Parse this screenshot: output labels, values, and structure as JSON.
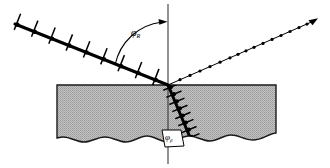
{
  "figure": {
    "background_color": "#ffffff",
    "width": 330,
    "height": 168
  },
  "labels": {
    "angle_of_incidence": {
      "symbol": "φ",
      "subscript": "R"
    },
    "angle_of_refraction": {
      "symbol": "φ",
      "subscript": "β"
    }
  },
  "elements": {
    "normal_line": {
      "name": "normal-line",
      "x": 168,
      "y_top": 4,
      "y_bottom": 164,
      "color": "#3a3a3a"
    },
    "medium_block": {
      "name": "medium-block",
      "left": 57,
      "right": 276,
      "top": 85,
      "bottom": 140,
      "fill_color": "#b9b9b9",
      "edge_color": "#1a1a1a",
      "texture": "halftone-dot-screen"
    },
    "incident_ray": {
      "name": "incident-ray",
      "x1": 15,
      "y1": 24,
      "x2": 168,
      "y2": 85,
      "style": "thick-barbed",
      "color": "#000000",
      "tick_count": 9,
      "dot_count": 9
    },
    "reflected_ray": {
      "name": "reflected-ray",
      "x1": 168,
      "y1": 85,
      "x2": 318,
      "y2": 19,
      "style": "thin-dotted",
      "color": "#000000",
      "dot_count": 15,
      "arrowhead": true
    },
    "refracted_ray": {
      "name": "refracted-ray",
      "x1": 168,
      "y1": 85,
      "x2": 192,
      "y2": 141,
      "style": "thick-barbed",
      "color": "#000000",
      "tick_count": 8,
      "dot_count": 8
    },
    "angle_arc": {
      "name": "angle-of-incidence-arc",
      "color": "#000000",
      "arrowhead": true
    },
    "refraction_callout_box": {
      "name": "refraction-angle-callout-box",
      "fill_color": "#ffffff",
      "edge_color": "#000000"
    }
  }
}
